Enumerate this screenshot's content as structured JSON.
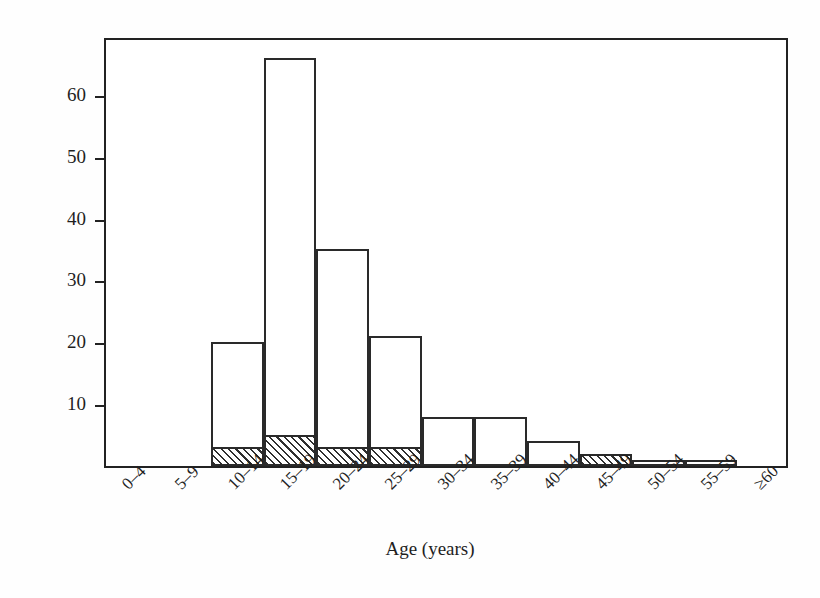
{
  "chart_data": {
    "type": "bar",
    "title": "",
    "xlabel": "Age (years)",
    "ylabel": "Cases (no.)",
    "categories": [
      "0–4",
      "5–9",
      "10–14",
      "15–19",
      "20–24",
      "25–29",
      "30–34",
      "35–39",
      "40–44",
      "45–49",
      "50–54",
      "55–59",
      "≥60"
    ],
    "series": [
      {
        "name": "Total cases",
        "values": [
          0,
          0,
          20,
          66,
          35,
          21,
          8,
          8,
          4,
          2,
          1,
          1,
          0
        ]
      },
      {
        "name": "Hatched subset",
        "values": [
          0,
          0,
          3,
          5,
          3,
          3,
          0,
          0,
          0,
          2,
          0,
          0,
          0
        ]
      }
    ],
    "ylim": [
      0,
      69.5
    ],
    "yticks": [
      10,
      20,
      30,
      40,
      50,
      60
    ],
    "ytick_labels": [
      "10",
      "20",
      "30",
      "40",
      "50",
      "60"
    ],
    "grid": false,
    "legend": "none",
    "bar_fill": "#ffffff",
    "bar_edge": "#2a2a2a",
    "hatch_color": "#2f2f2f",
    "hatch_pattern": "forward-diagonal"
  }
}
